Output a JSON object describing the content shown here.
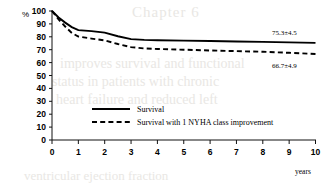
{
  "chart_data": {
    "type": "line",
    "title": "",
    "xlabel": "years",
    "ylabel": "%",
    "xlim": [
      0,
      10
    ],
    "ylim": [
      0,
      100
    ],
    "grid": false,
    "legend_position": "center",
    "x_ticks": [
      "0",
      "1",
      "2",
      "3",
      "4",
      "5",
      "6",
      "7",
      "8",
      "9",
      "10"
    ],
    "y_ticks": [
      "0",
      "10",
      "20",
      "30",
      "40",
      "50",
      "60",
      "70",
      "80",
      "90",
      "100"
    ],
    "series": [
      {
        "name": "Survival",
        "style": "solid",
        "x": [
          0,
          0.25,
          0.5,
          0.75,
          1,
          1.5,
          2,
          2.5,
          3,
          3.5,
          4,
          5,
          6,
          7,
          8,
          9,
          10
        ],
        "values": [
          100,
          95,
          91,
          87.5,
          85.2,
          84.4,
          83.2,
          80.4,
          78.2,
          77.6,
          77.3,
          77.0,
          76.7,
          76.4,
          76.1,
          75.7,
          75.3
        ],
        "end_label": "75.3±4.5"
      },
      {
        "name": "Survival with 1 NYHA class improvement",
        "style": "dashed",
        "x": [
          0,
          0.25,
          0.5,
          0.75,
          1,
          1.5,
          2,
          2.5,
          3,
          3.5,
          4,
          5,
          6,
          7,
          8,
          9,
          10
        ],
        "values": [
          100,
          93.5,
          88,
          83,
          80.2,
          78.6,
          77.2,
          74.4,
          72.0,
          71.0,
          70.6,
          70.0,
          69.4,
          68.9,
          68.4,
          67.6,
          66.7
        ],
        "end_label": "66.7±4.9"
      }
    ],
    "annotations": [
      {
        "text": "75.3±4.5",
        "series": "Survival"
      },
      {
        "text": "66.7±4.9",
        "series": "Survival with 1 NYHA class improvement"
      }
    ]
  },
  "axis": {
    "y_title": "%",
    "x_title": "years"
  },
  "legend": {
    "entries": [
      {
        "label": "Survival",
        "style": "solid"
      },
      {
        "label": "Survival with 1 NYHA class improvement",
        "style": "dashed"
      }
    ]
  },
  "background_bleed": {
    "title": "Chapter 6",
    "line1": "improves survival and functional",
    "line2": "status in patients with chronic",
    "line3": "heart failure and reduced left",
    "line4": "ventricular ejection fraction"
  }
}
